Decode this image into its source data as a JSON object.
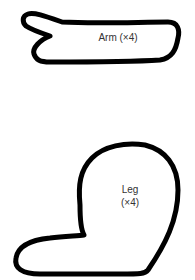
{
  "shapes": {
    "arm": {
      "label": "Arm (×4)"
    },
    "leg": {
      "label_line1": "Leg",
      "label_line2": "(×4)"
    }
  },
  "colors": {
    "outline": "#000000",
    "background": "#ffffff",
    "text": "#333333"
  }
}
